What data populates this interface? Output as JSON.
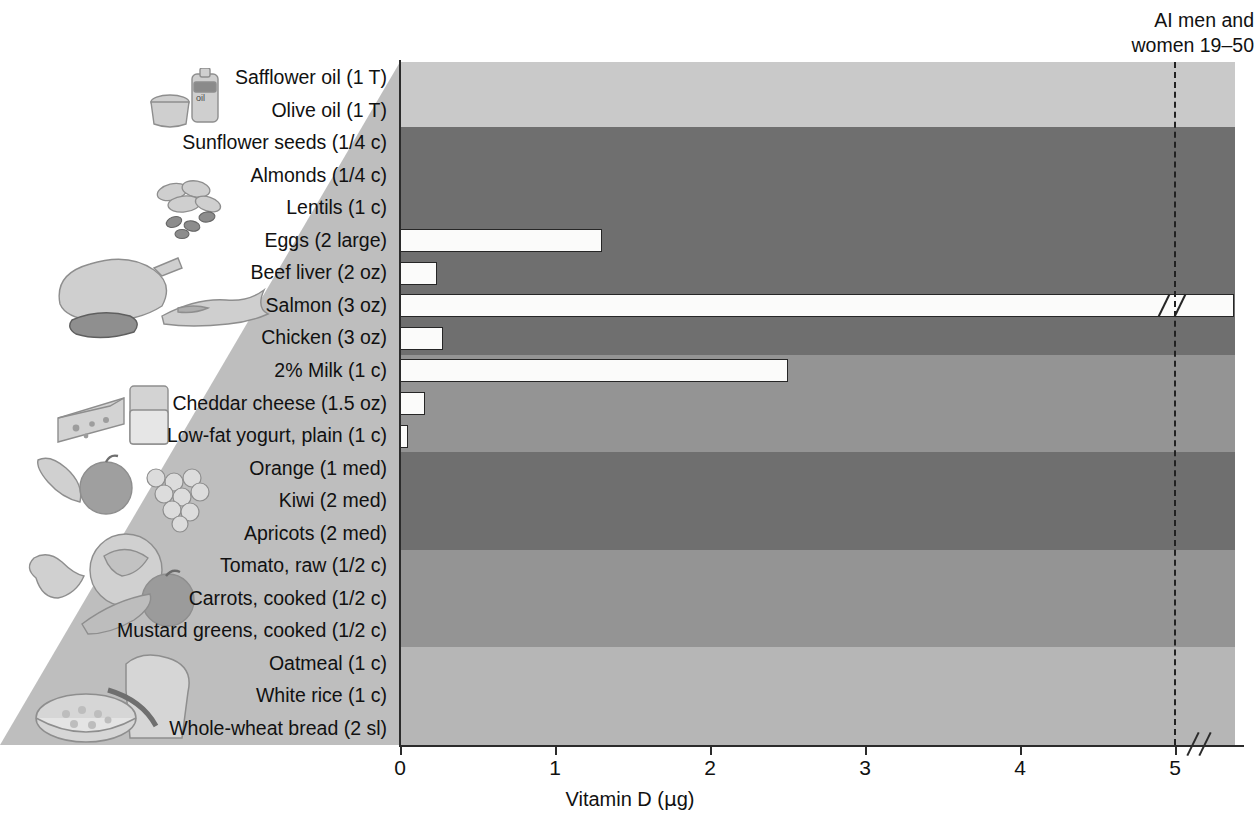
{
  "chart_data": {
    "type": "bar",
    "orientation": "horizontal",
    "title": "",
    "xlabel": "Vitamin D (µg)",
    "ylabel": "",
    "xlim": [
      0,
      5.4
    ],
    "xticks": [
      0,
      1,
      2,
      3,
      4,
      5
    ],
    "xticklabels": [
      "0",
      "1",
      "2",
      "3",
      "4",
      "5"
    ],
    "axis_break": true,
    "axis_break_note": "axis broken just after 5",
    "grid": false,
    "legend": "none",
    "reference_line": {
      "label": "AI men and women 19–50",
      "value": 5,
      "style": "dashed"
    },
    "categories": [
      "Safflower oil (1 T)",
      "Olive oil (1 T)",
      "Sunflower seeds (1/4 c)",
      "Almonds (1/4 c)",
      "Lentils (1 c)",
      "Eggs (2 large)",
      "Beef liver (2 oz)",
      "Salmon (3 oz)",
      "Chicken (3 oz)",
      "2% Milk (1 c)",
      "Cheddar cheese (1.5 oz)",
      "Low-fat yogurt, plain (1 c)",
      "Orange (1 med)",
      "Kiwi (2 med)",
      "Apricots (2 med)",
      "Tomato, raw (1/2 c)",
      "Carrots, cooked (1/2 c)",
      "Mustard greens, cooked (1/2 c)",
      "Oatmeal (1 c)",
      "White rice (1 c)",
      "Whole-wheat bread (2 sl)"
    ],
    "values": [
      0,
      0,
      0,
      0,
      0,
      1.3,
      0.24,
      5.4,
      0.28,
      2.5,
      0.16,
      0.05,
      0,
      0,
      0,
      0,
      0,
      0,
      0,
      0,
      0
    ],
    "broken_bars": [
      "Salmon (3 oz)"
    ],
    "food_groups": [
      {
        "name": "fats-and-oils",
        "rows": [
          0,
          1
        ],
        "color": "#c9c9c9"
      },
      {
        "name": "nuts-seeds-legumes-and-protein",
        "rows": [
          2,
          3,
          4,
          5,
          6,
          7,
          8
        ],
        "color": "#6f6f6f"
      },
      {
        "name": "dairy",
        "rows": [
          9,
          10,
          11
        ],
        "color": "#949494"
      },
      {
        "name": "fruits",
        "rows": [
          12,
          13,
          14
        ],
        "color": "#6f6f6f"
      },
      {
        "name": "vegetables",
        "rows": [
          15,
          16,
          17
        ],
        "color": "#949494"
      },
      {
        "name": "grains",
        "rows": [
          18,
          19,
          20
        ],
        "color": "#b6b6b6"
      }
    ]
  },
  "axis": {
    "x_title_main": "Vitamin D (",
    "x_title_unit": "µ",
    "x_title_tail": "g)"
  },
  "annotation": {
    "ai_line_1": "AI men and",
    "ai_line_2": "women 19–50"
  },
  "illustrations": [
    {
      "name": "oils-bottle-and-cup-illustration",
      "group": "fats-and-oils"
    },
    {
      "name": "nuts-and-seeds-illustration",
      "group": "nuts-seeds-legumes"
    },
    {
      "name": "meat-poultry-fish-illustration",
      "group": "protein"
    },
    {
      "name": "cheese-and-milk-illustration",
      "group": "dairy"
    },
    {
      "name": "fruits-illustration",
      "group": "fruits"
    },
    {
      "name": "vegetables-illustration",
      "group": "vegetables"
    },
    {
      "name": "bread-and-oatmeal-illustration",
      "group": "grains"
    }
  ],
  "colors": {
    "bar_fill": "#fbfbfa",
    "bar_stroke": "#262626",
    "band_light": "#c9c9c9",
    "band_dark": "#6f6f6f",
    "band_medium": "#949494",
    "band_grain": "#b6b6b6",
    "axis": "#2b2b2b",
    "text": "#111111"
  }
}
